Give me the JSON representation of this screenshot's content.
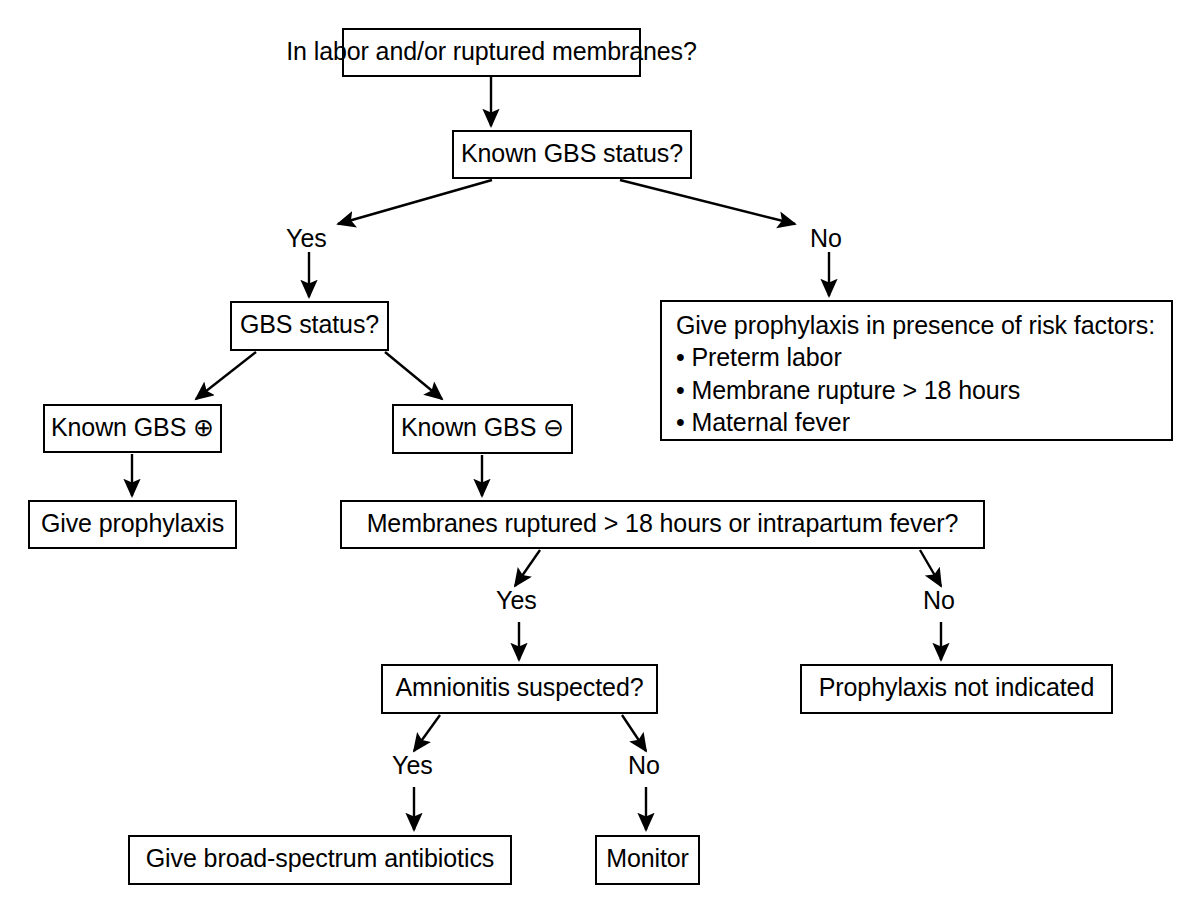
{
  "diagram": {
    "stroke_color": "#000000",
    "fill_color": "#ffffff",
    "nodes": [
      {
        "id": "n1",
        "label": "In labor and/or ruptured membranes?"
      },
      {
        "id": "n2",
        "label": "Known GBS status?"
      },
      {
        "id": "n3",
        "label": "GBS status?"
      },
      {
        "id": "n4",
        "label": "Known GBS ⊕"
      },
      {
        "id": "n5",
        "label": "Known GBS ⊖"
      },
      {
        "id": "n6",
        "label": "Give prophylaxis"
      },
      {
        "id": "n7",
        "label": "Membranes ruptured > 18 hours or intrapartum fever?"
      },
      {
        "id": "n8",
        "label": "Amnionitis suspected?"
      },
      {
        "id": "n9",
        "label": "Prophylaxis not indicated"
      },
      {
        "id": "n10",
        "label": "Give broad-spectrum antibiotics"
      },
      {
        "id": "n11",
        "label": "Monitor"
      }
    ],
    "risk_box": {
      "heading": "Give prophylaxis in presence of risk factors:",
      "items": [
        "• Preterm labor",
        "• Membrane rupture > 18 hours",
        "• Maternal fever"
      ]
    },
    "edge_labels": {
      "gbs_status_yes": "Yes",
      "gbs_status_no": "No",
      "membranes_yes": "Yes",
      "membranes_no": "No",
      "amnionitis_yes": "Yes",
      "amnionitis_no": "No"
    }
  }
}
